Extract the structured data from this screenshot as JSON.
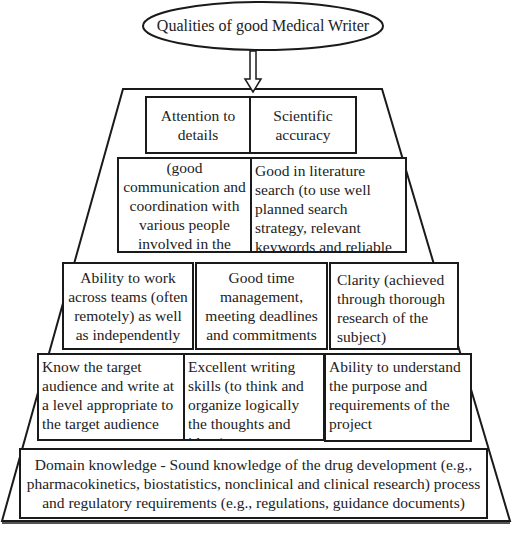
{
  "title": "Qualities of good Medical Writer",
  "rows": [
    {
      "boxes": [
        {
          "text": "Attention to details"
        },
        {
          "text": "Scientific accuracy"
        }
      ]
    },
    {
      "boxes": [
        {
          "text": "Interpersonal skills (good communication and coordination with various people involved in the process)"
        },
        {
          "text": "Good in literature search (to use well planned search strategy, relevant keywords and reliable sources)"
        }
      ]
    },
    {
      "boxes": [
        {
          "text": "Ability to work across teams (often remotely) as well as independently"
        },
        {
          "text": "Good time management, meeting deadlines and commitments"
        },
        {
          "text": "Clarity (achieved through thorough research of the subject)"
        }
      ]
    },
    {
      "boxes": [
        {
          "text": "Know the target audience and write at a level appropriate to the target audience"
        },
        {
          "text": "Excellent writing skills (to think and organize logically the thoughts and ideas)"
        },
        {
          "text": "Ability to understand the purpose and requirements of the project"
        }
      ]
    },
    {
      "boxes": [
        {
          "text": "Domain knowledge - Sound knowledge of the drug development (e.g., pharmacokinetics, biostatistics, nonclinical and clinical research) process and regulatory requirements (e.g., regulations, guidance documents)"
        }
      ]
    }
  ],
  "colors": {
    "stroke": "#1a1a1a",
    "background": "#ffffff",
    "text": "#222222"
  }
}
